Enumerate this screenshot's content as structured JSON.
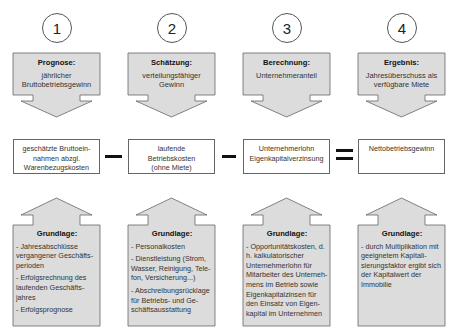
{
  "colors": {
    "box_fill": "#dcdcdc",
    "box_stroke": "#666666",
    "operator": "#111111"
  },
  "steps": [
    {
      "number": "1",
      "top": {
        "title": "Prognose:",
        "text": [
          "jährlicher",
          "Bruttobetriebsgewinn"
        ]
      },
      "middle": [
        "geschätzte Bruttoein-",
        "nahmen abzgl.",
        "Warenbezugskosten"
      ],
      "bottom": {
        "title": "Grundlage:",
        "items": [
          "- Jahresabschlüsse vergangener Geschäfts-perioden",
          "- Erfolgsrechnung des laufenden Geschäfts-jahres",
          "- Erfolgsprognose"
        ]
      }
    },
    {
      "number": "2",
      "top": {
        "title": "Schätzung:",
        "text": [
          "verteilungsfähiger",
          "Gewinn"
        ]
      },
      "middle": [
        "laufende",
        "Betriebskosten",
        "(ohne Miete)"
      ],
      "bottom": {
        "title": "Grundlage:",
        "items": [
          "- Personalkosten",
          "- Dienstleistung (Strom, Wasser, Reinigung, Tele-fon, Versicherung...)",
          "- Abschreibungsrücklage für Betriebs- und Ge-schäftsausstattung"
        ]
      }
    },
    {
      "number": "3",
      "top": {
        "title": "Berechnung:",
        "text": [
          "Unternehmeranteil"
        ]
      },
      "middle": [
        "Unternehmerlohn",
        "Eigenkapitalverzinsung"
      ],
      "bottom": {
        "title": "Grundlage:",
        "items": [
          "- Opportunitätskosten, d. h. kalkulatorischer Unternehmerlohn für Mitarbeiter des Unterneh-mens im Betrieb sowie Eigenkapitalzinsen für den Einsatz von Eigen-kapital im Unternehmen"
        ]
      }
    },
    {
      "number": "4",
      "top": {
        "title": "Ergebnis:",
        "text": [
          "Jahresüberschuss als",
          "verfügbare Miete"
        ]
      },
      "middle": [
        "Nettobetriebsgewinn"
      ],
      "bottom": {
        "title": "Grundlage:",
        "items": [
          "- durch Multiplikation mit geeignetem Kapitali-sierungsfaktor ergibt sich der Kapitalwert der Immobilie"
        ]
      }
    }
  ],
  "operators": [
    "minus",
    "minus",
    "equals"
  ]
}
